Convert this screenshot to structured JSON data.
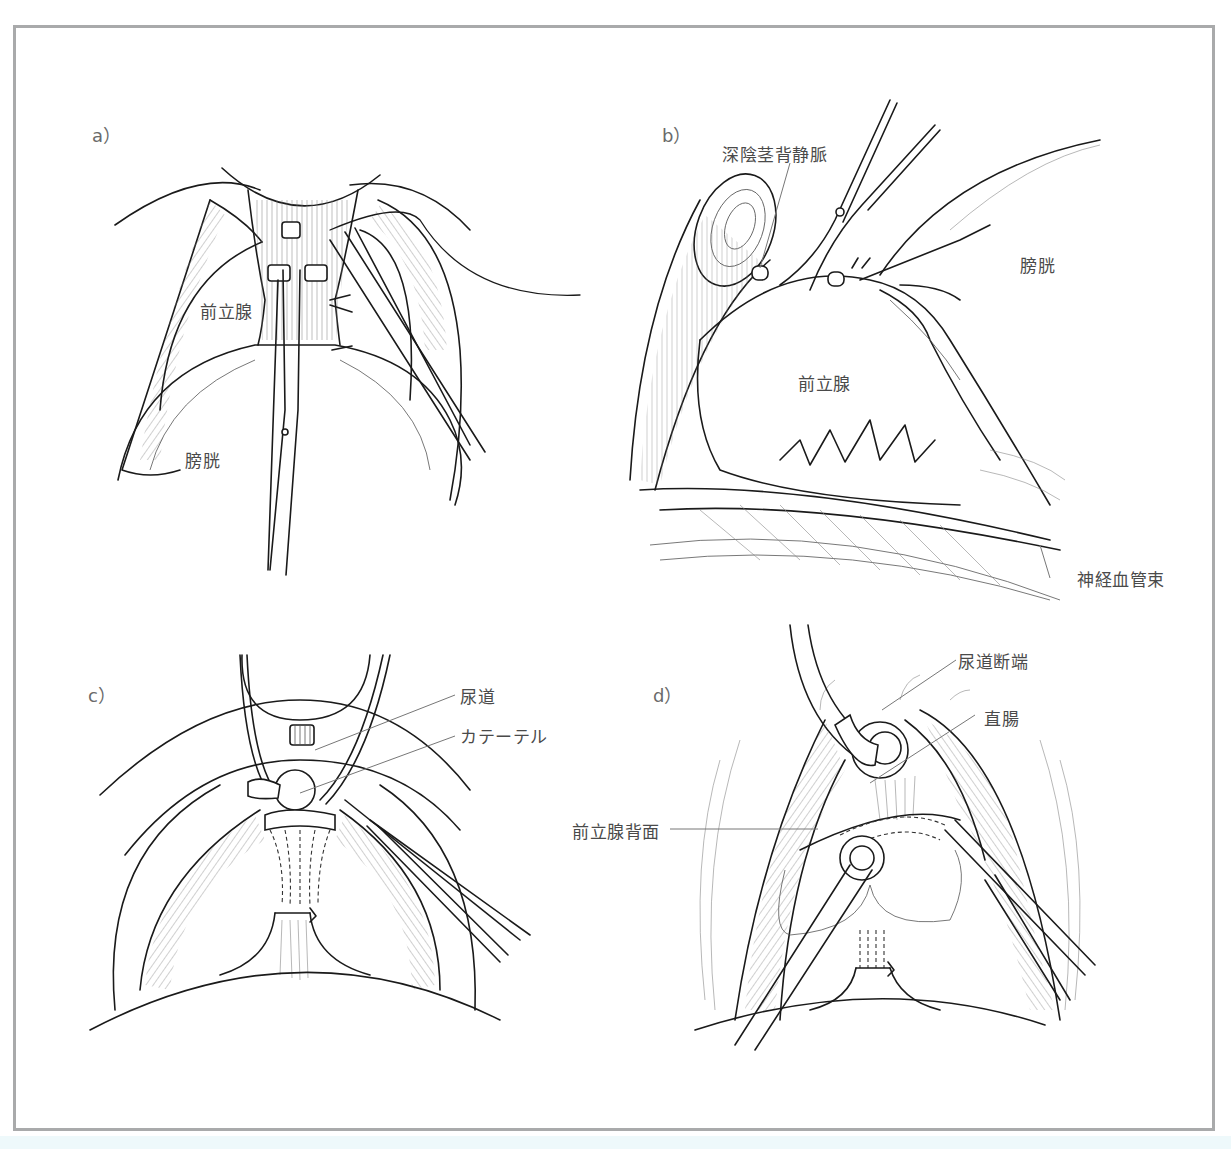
{
  "figure": {
    "frame_color": "#a9aaab",
    "text_color": "#4a4a4a",
    "line_color": "#1a1a1a",
    "panels": [
      {
        "id": "a",
        "letter": "a）",
        "labels": [
          {
            "text": "前立腺",
            "meaning": "prostate"
          },
          {
            "text": "膀胱",
            "meaning": "bladder"
          }
        ]
      },
      {
        "id": "b",
        "letter": "b）",
        "labels": [
          {
            "text": "深陰茎背静脈",
            "meaning": "deep dorsal vein of penis"
          },
          {
            "text": "膀胱",
            "meaning": "bladder"
          },
          {
            "text": "前立腺",
            "meaning": "prostate"
          },
          {
            "text": "神経血管束",
            "meaning": "neurovascular bundle"
          }
        ]
      },
      {
        "id": "c",
        "letter": "c）",
        "labels": [
          {
            "text": "尿道",
            "meaning": "urethra"
          },
          {
            "text": "カテーテル",
            "meaning": "catheter"
          }
        ]
      },
      {
        "id": "d",
        "letter": "d）",
        "labels": [
          {
            "text": "尿道断端",
            "meaning": "urethral stump"
          },
          {
            "text": "直腸",
            "meaning": "rectum"
          },
          {
            "text": "前立腺背面",
            "meaning": "posterior surface of prostate"
          }
        ]
      }
    ]
  }
}
